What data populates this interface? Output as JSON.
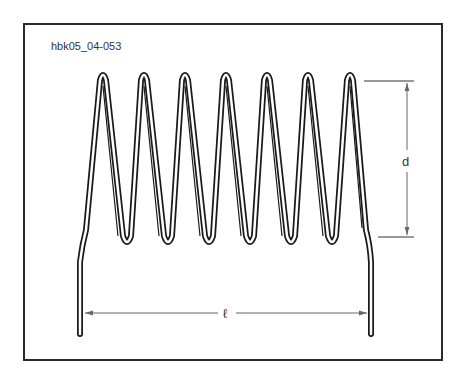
{
  "figure": {
    "id_label": "hbk05_04-053",
    "turns": 7
  },
  "dimensions": {
    "diameter_label": "d",
    "length_label": "ℓ"
  },
  "colors": {
    "stroke": "#1a1a1a",
    "dimension_line": "#555555",
    "frame": "#2a2a2a",
    "background": "#ffffff"
  }
}
